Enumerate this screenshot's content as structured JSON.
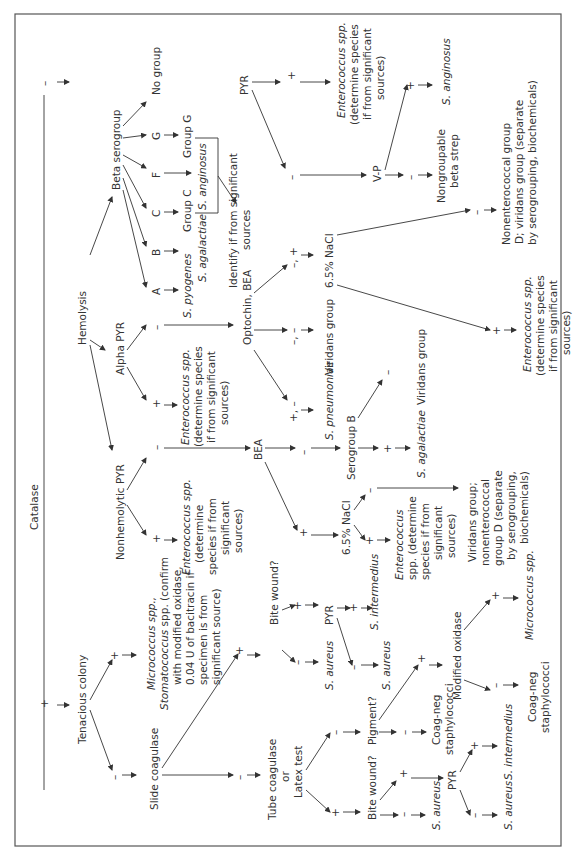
{
  "diagram": {
    "title": "Catalase",
    "orientation": "rotated-90-ccw",
    "frame_color": "#555555",
    "text_color": "#333333",
    "nodes": {
      "catalase": "Catalase",
      "cat_neg": "–",
      "cat_pos": "+",
      "hemolysis": "Hemolysis",
      "beta_serogroup": "Beta serogroup",
      "alpha_pyr": "Alpha PYR",
      "nonhemolytic_pyr": "Nonhemolytic PYR",
      "beta_no_group": "No group",
      "beta_g": "G",
      "beta_f": "F",
      "beta_c": "C",
      "beta_b": "B",
      "beta_a": "A",
      "group_g": "Group G",
      "group_c": "Group C",
      "s_anginosus_beta": "S. anginosus",
      "s_agalactiae_beta": "S. agalactiae",
      "s_pyogenes": "S. pyogenes",
      "identify_sig": [
        "Identify if from significant",
        "sources"
      ],
      "beta_pyr": "PYR",
      "beta_pyr_pos": "+",
      "beta_pyr_neg": "–",
      "beta_entero": [
        "Enterococcus spp.",
        "(determine species",
        "if from significant",
        "sources)"
      ],
      "vp": "V-P",
      "vp_pos": "+",
      "vp_neg": "–",
      "s_anginosus_vp": "S. anginosus",
      "nongroupable": [
        "Nongroupable",
        "beta strep"
      ],
      "alpha_neg": "–",
      "alpha_pos": "+",
      "alpha_entero": [
        "Enterococcus spp.",
        "(determine species",
        "if from significant",
        "sources)"
      ],
      "optochin_bea": "Optochin, BEA",
      "opt_neg_pos": "–, +",
      "opt_neg_neg": "–, –",
      "opt_pos_neg": "+, –",
      "nacl_alpha": "6.5% NaCl",
      "viridans_opt": "Viridans group",
      "s_pneumoniae": "S. pneumoniae",
      "nacl_alpha_neg": "–",
      "nacl_alpha_pos": "+",
      "nonentero_d": [
        "Nonenterococcal group",
        "D; viridans group (separate",
        "by serogrouping, biochemicals)"
      ],
      "alpha_nacl_entero": [
        "Enterococcus spp.",
        "(determine species",
        "if from significant",
        "sources)"
      ],
      "nonhemo_neg": "–",
      "nonhemo_pos": "+",
      "nonhemo_entero": [
        "Enterococcus spp.",
        "(determine",
        "species if from",
        "significant",
        "sources)"
      ],
      "bea": "BEA",
      "bea_neg": "–",
      "bea_pos": "+",
      "serogroup_b": "Serogroup B",
      "serob_pos": "+",
      "serob_neg": "–",
      "s_agalactiae_nonhemo": "S. agalactiae",
      "viridans_serob": "Viridans group",
      "nacl_nonhemo": "6.5% NaCl",
      "nacl_nonhemo_neg": "–",
      "nacl_nonhemo_pos": "+",
      "viridans_nonentero": [
        "Viridans group;",
        "nonenterococcal",
        "group D (separate",
        "by serogrouping,",
        "biochemicals)"
      ],
      "nacl_nonhemo_entero": [
        "Enterococcus",
        "spp. (determine",
        "species if from",
        "significant",
        "sources)"
      ],
      "tenacious": "Tenacious colony",
      "ten_pos": "+",
      "ten_neg": "–",
      "micrococcus_stomato": [
        "Micrococcus spp.,",
        "Stomatococcus spp. (confirm",
        "with modified oxidase,",
        "0.04 U of bacitracin if",
        "specimen is from",
        "significant source)"
      ],
      "slide_coag": "Slide coagulase",
      "slide_pos": "+",
      "slide_neg": "–",
      "bite_wound_1": "Bite wound?",
      "bite1_neg": "–",
      "bite1_pos": "+",
      "s_aureus_1": "S. aureus",
      "pyr_1": "PYR",
      "pyr1_pos": "+",
      "pyr1_neg": "–",
      "s_intermedius_1": "S. intermedius",
      "s_aureus_2": "S. aureus",
      "tube_coag": [
        "Tube coagulase",
        "or",
        "Latex test"
      ],
      "tube_pos": "+",
      "tube_neg": "–",
      "pigment": "Pigment?",
      "pig_pos": "+",
      "pig_neg": "–",
      "modified_oxidase": "Modified oxidase",
      "mo_pos": "+",
      "mo_neg": "–",
      "micrococcus": "Micrococcus spp.",
      "coag_neg_staph_mo": [
        "Coag-neg",
        "staphylococci"
      ],
      "coag_neg_staph_pig": [
        "Coag-neg",
        "staphylococci"
      ],
      "bite_wound_2": "Bite wound?",
      "bite2_pos": "+",
      "bite2_neg": "–",
      "s_aureus_3": "S. aureus",
      "pyr_2": "PYR",
      "pyr2_pos": "+",
      "pyr2_neg": "–",
      "s_intermedius_2": "S. intermedius",
      "s_aureus_4": "S. aureus"
    }
  }
}
